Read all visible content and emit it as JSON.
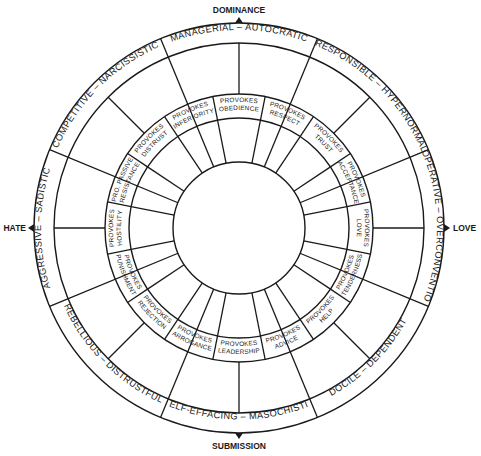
{
  "diagram": {
    "colors": {
      "line": "#1a1a1a",
      "background": "#ffffff"
    },
    "axes": {
      "top": "DOMINANCE",
      "bottom": "SUBMISSION",
      "left": "HATE",
      "right": "LOVE"
    },
    "outer_octants": [
      {
        "label": "MANAGERIAL – AUTOCRATIC",
        "angle": 90
      },
      {
        "label": "RESPONSIBLE – HYPERNORMAL",
        "angle": 45
      },
      {
        "label": "COOPERATIVE – OVERCONVENTIONAL",
        "angle": 0
      },
      {
        "label": "DOCILE – DEPENDENT",
        "angle": -45
      },
      {
        "label": "SELF-EFFACING – MASOCHISTIC",
        "angle": -90
      },
      {
        "label": "REBELLIOUS – DISTRUSTFUL",
        "angle": -135
      },
      {
        "label": "AGGRESSIVE – SADISTIC",
        "angle": 180
      },
      {
        "label": "COMPETITIVE – NARCISSISTIC",
        "angle": 135
      }
    ],
    "inner_segments": [
      {
        "line1": "PROVOKES",
        "line2": "OBEDIENCE",
        "angle": 90
      },
      {
        "line1": "PROVOKES",
        "line2": "RESPECT",
        "angle": 67.5
      },
      {
        "line1": "PROVOKES",
        "line2": "TRUST",
        "angle": 45
      },
      {
        "line1": "PROVOKES",
        "line2": "ACCEPTANCE",
        "angle": 22.5
      },
      {
        "line1": "PROVOKES",
        "line2": "LOVE",
        "angle": 0
      },
      {
        "line1": "PROVOKES",
        "line2": "TENDERNESS",
        "angle": -22.5
      },
      {
        "line1": "PROVOKES",
        "line2": "HELP",
        "angle": -45
      },
      {
        "line1": "PROVOKES",
        "line2": "ADVICE",
        "angle": -67.5
      },
      {
        "line1": "PROVOKES",
        "line2": "LEADERSHIP",
        "angle": -90
      },
      {
        "line1": "PROVOKES",
        "line2": "ARROGANCE",
        "angle": -112.5
      },
      {
        "line1": "PROVOKES",
        "line2": "REJECTION",
        "angle": -135
      },
      {
        "line1": "PROVOKES",
        "line2": "PUNISHMENT",
        "angle": -157.5
      },
      {
        "line1": "PROVOKES",
        "line2": "HOSTILITY",
        "angle": 180
      },
      {
        "line1": "PRO. PASSIVE",
        "line2": "RESISTANCE",
        "angle": 157.5
      },
      {
        "line1": "PROVOKES",
        "line2": "DISTRUST",
        "angle": 135
      },
      {
        "line1": "PROVOKES",
        "line2": "INFERIORITY",
        "angle": 112.5
      }
    ]
  }
}
